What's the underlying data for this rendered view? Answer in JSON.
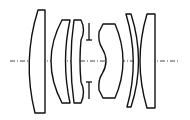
{
  "diagram": {
    "type": "optical lens cross-section",
    "colors": {
      "background": "#ffffff",
      "stroke": "#111111",
      "axis": "#333333"
    },
    "optical_axis": {
      "y": 61,
      "x_start": 10,
      "x_end": 180,
      "style": "dash-dot"
    },
    "elements": [
      {
        "id": "L1",
        "kind": "plano-convex",
        "path": "M38,10 L45,10 L45,113 L35,113 Q22,61 38,10 Z"
      },
      {
        "id": "L2",
        "kind": "meniscus",
        "path": "M62,20 L70,20 Q61,61 70,103 L62,103 Q40,61 62,20 Z"
      },
      {
        "id": "L3",
        "kind": "meniscus",
        "path": "M74,20 L81,20 Q86,30 81,40 Q79,61 81,82 Q86,92 81,103 L74,103 Q68,61 74,20 Z"
      },
      {
        "id": "L4",
        "kind": "biconvex",
        "path": "M103,24 L115,24 Q131,61 115,98 L103,98 L99,90 Q98,80 102,74 Q110,61 102,48 Q98,42 99,32 Z"
      },
      {
        "id": "L5",
        "kind": "meniscus",
        "path": "M126,14 L131,14 Q146,61 131,107 L127,107 Q140,61 126,14 Z"
      },
      {
        "id": "L6",
        "kind": "concave-plano",
        "path": "M147,14 L155,14 L155,108 L147,108 Q133,61 147,14 Z"
      }
    ],
    "aperture_stop": {
      "x": 89,
      "top": {
        "y1": 23,
        "y2": 40,
        "tick_y": 40
      },
      "bottom": {
        "y1": 82,
        "y2": 99,
        "tick_y": 82
      },
      "tick_half_width": 3
    }
  }
}
